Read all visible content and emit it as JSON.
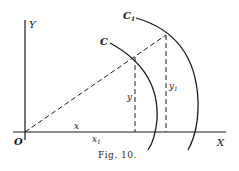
{
  "figure": {
    "caption": "Fig. 10.",
    "labels": {
      "origin": "O",
      "x_axis": "X",
      "y_axis": "Y",
      "curve_inner": "C",
      "curve_outer": "C",
      "curve_outer_sub": "1",
      "x": "x",
      "x1": "x",
      "x1_sub": "1",
      "y": "y",
      "y1": "y",
      "y1_sub": "1"
    },
    "colors": {
      "ink": "#1a1a1a",
      "background": "#ffffff"
    }
  }
}
